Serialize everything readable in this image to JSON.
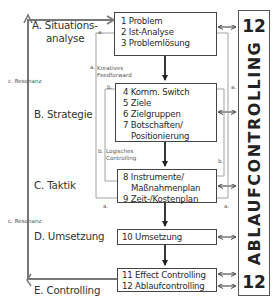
{
  "phases": [
    {
      "id": "A",
      "label_line1": "A. Situations-",
      "label_line2": "analyse"
    },
    {
      "id": "B",
      "label": "B. Strategie"
    },
    {
      "id": "C",
      "label": "C. Taktik"
    },
    {
      "id": "D",
      "label": "D. Umsetzung"
    },
    {
      "id": "E",
      "label": "E. Controlling"
    }
  ],
  "boxes": {
    "situation": [
      "1 Problem",
      "2 Ist-Analyse",
      "3 Problemlösung"
    ],
    "strategy": [
      "4 Komm. Switch",
      "5 Ziele",
      "6 Zielgruppen",
      "7 Botschaften/",
      "Positionierung"
    ],
    "tactic": [
      "8 Instrumente/",
      "Maßnahmenplan",
      "9 Zeit-/Kostenplan"
    ],
    "implementation": [
      "10 Umsetzung"
    ],
    "controlling": [
      "11 Effect Controlling",
      "12 Ablaufcontrolling"
    ]
  },
  "annotations": {
    "resonance": "c. Resonanz",
    "a": "a.",
    "b": "b.",
    "creative_1": "Kreatives",
    "creative_2": "Feedforward",
    "logical_1": "Logisches",
    "logical_2": "Controlling"
  },
  "side_bar": {
    "top_number": "12",
    "bottom_number": "12",
    "text": "ABLAUFCONTROLLING"
  },
  "colors": {
    "line": "#333333",
    "thin_line": "#888888",
    "back_arrow": "#666666"
  }
}
